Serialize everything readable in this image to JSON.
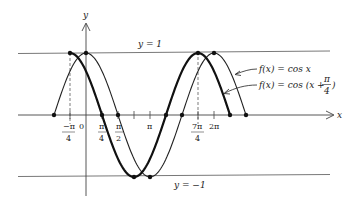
{
  "chart_data": {
    "type": "line",
    "title": "",
    "xlabel": "x",
    "ylabel": "y",
    "x_tick_labels": [
      "-π/4",
      "0",
      "π/4",
      "π/2",
      "π",
      "7π/4",
      "2π"
    ],
    "x_tick_values": [
      -0.7854,
      0,
      0.7854,
      1.5708,
      3.1416,
      5.4978,
      6.2832
    ],
    "ylim": [
      -1,
      1
    ],
    "reference_lines": [
      {
        "label": "y = 1",
        "y": 1
      },
      {
        "label": "y = −1",
        "y": -1
      }
    ],
    "series": [
      {
        "name": "f(x) = cos x",
        "style": "thin",
        "x_range": [
          -1.5708,
          7.854
        ],
        "key_points": [
          [
            -1.5708,
            0
          ],
          [
            0,
            1
          ],
          [
            1.5708,
            0
          ],
          [
            3.1416,
            -1
          ],
          [
            4.7124,
            0
          ],
          [
            6.2832,
            1
          ],
          [
            7.854,
            0
          ]
        ]
      },
      {
        "name": "f(x) = cos (x + π/4)",
        "style": "thick",
        "x_range": [
          -0.7854,
          7.0686
        ],
        "key_points": [
          [
            -0.7854,
            1
          ],
          [
            0.7854,
            0
          ],
          [
            2.3562,
            -1
          ],
          [
            3.927,
            0
          ],
          [
            5.4978,
            1
          ],
          [
            7.0686,
            0
          ]
        ]
      }
    ],
    "annotations": [
      "f(x) = cos x",
      "f(x) = cos (x + π/4)"
    ],
    "grid": false
  },
  "labels": {
    "y_axis": "y",
    "x_axis": "x",
    "y_one": "y = 1",
    "y_neg_one": "y = −1",
    "legend_cos": "f(x) = cos x",
    "legend_shift_prefix": "f(x) = cos (x + ",
    "legend_shift_num": "π",
    "legend_shift_den": "4",
    "legend_shift_suffix": ")",
    "tick_neg_pi4_num": "−π",
    "tick_neg_pi4_den": "4",
    "tick_zero": "0",
    "tick_pi4_num": "π",
    "tick_pi4_den": "4",
    "tick_pi2_num": "π",
    "tick_pi2_den": "2",
    "tick_pi": "π",
    "tick_7pi4_num": "7π",
    "tick_7pi4_den": "4",
    "tick_2pi": "2π"
  }
}
